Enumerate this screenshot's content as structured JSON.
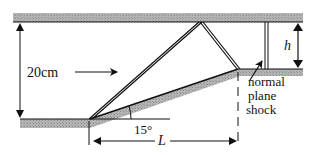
{
  "diagram": {
    "type": "supersonic inlet / diffuser with 15-degree wedge ramp and normal shock",
    "labels": {
      "height": "20cm",
      "angle": "15°",
      "length": "L",
      "throat_height": "h",
      "shock_line1": "normal",
      "shock_line2": "plane",
      "shock_line3": "shock"
    },
    "colors": {
      "wall_fill": "#a8a8a8",
      "line": "#111111",
      "background": "#ffffff"
    }
  }
}
